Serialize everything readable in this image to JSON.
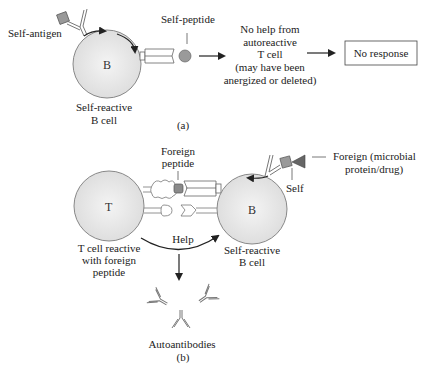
{
  "figure": {
    "panel_a": {
      "panel_label": "(a)",
      "self_antigen_label": "Self-antigen",
      "self_peptide_label": "Self-peptide",
      "b_cell_letter": "B",
      "b_cell_caption": [
        "Self-reactive",
        "B cell"
      ],
      "no_help_text": [
        "No help from",
        "autoreactive",
        "T cell",
        "(may have been",
        "anergized or deleted)"
      ],
      "outcome_box": "No response"
    },
    "panel_b": {
      "panel_label": "(b)",
      "foreign_peptide_label": [
        "Foreign",
        "peptide"
      ],
      "t_cell_letter": "T",
      "t_cell_caption": [
        "T cell reactive",
        "with foreign",
        "peptide"
      ],
      "b_cell_letter": "B",
      "b_cell_caption": [
        "Self-reactive",
        "B cell"
      ],
      "help_label": "Help",
      "self_label": "Self",
      "foreign_label": [
        "Foreign (microbial",
        "protein/drug)"
      ],
      "autoantibodies_label": "Autoantibodies"
    },
    "colors": {
      "cell_fill": "#e6e6e6",
      "cell_stroke": "#888888",
      "antigen_fill": "#999999",
      "peptide_fill": "#8a8a8a",
      "foreign_fill": "#666666",
      "line": "#222222"
    }
  }
}
